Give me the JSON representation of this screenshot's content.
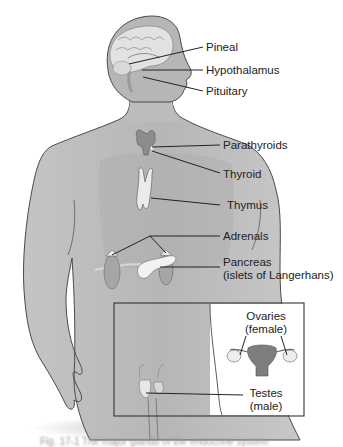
{
  "diagram": {
    "colors": {
      "background": "#ffffff",
      "skin": "#b9b9b9",
      "skin_light": "#d2d2d2",
      "outline": "#4a4a4a",
      "gland": "#eeeeee",
      "leader_line": "#222222",
      "text": "#222222"
    },
    "labels": [
      {
        "id": "pineal",
        "text": "Pineal"
      },
      {
        "id": "hypothalamus",
        "text": "Hypothalamus"
      },
      {
        "id": "pituitary",
        "text": "Pituitary"
      },
      {
        "id": "parathyroids",
        "text": "Parathyroids"
      },
      {
        "id": "thyroid",
        "text": "Thyroid"
      },
      {
        "id": "thymus",
        "text": "Thymus"
      },
      {
        "id": "adrenals",
        "text": "Adrenals"
      },
      {
        "id": "pancreas",
        "text": "Pancreas",
        "subtext": "(islets of Langerhans)"
      },
      {
        "id": "ovaries",
        "text": "Ovaries",
        "subtext": "(female)"
      },
      {
        "id": "testes",
        "text": "Testes",
        "subtext": "(male)"
      }
    ],
    "caption": "Fig. 17-1 The major glands of the endocrine system"
  }
}
